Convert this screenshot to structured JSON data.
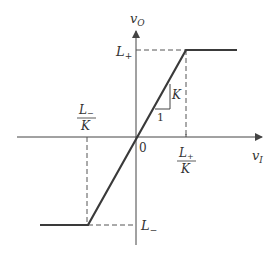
{
  "diagram": {
    "axes": {
      "x_label": "v",
      "x_label_sub": "I",
      "y_label": "v",
      "y_label_sub": "O",
      "origin_label": "0"
    },
    "labels": {
      "upper_limit": "L",
      "upper_limit_sub": "+",
      "lower_limit": "L",
      "lower_limit_sub": "−",
      "pos_threshold_num": "L",
      "pos_threshold_num_sub": "+",
      "pos_threshold_den": "K",
      "neg_threshold_num": "L",
      "neg_threshold_num_sub": "−",
      "neg_threshold_den": "K",
      "slope_rise": "K",
      "slope_run": "1"
    },
    "colors": {
      "curve": "#3a3a3a",
      "axis": "#444444",
      "dashed": "#555555"
    }
  }
}
